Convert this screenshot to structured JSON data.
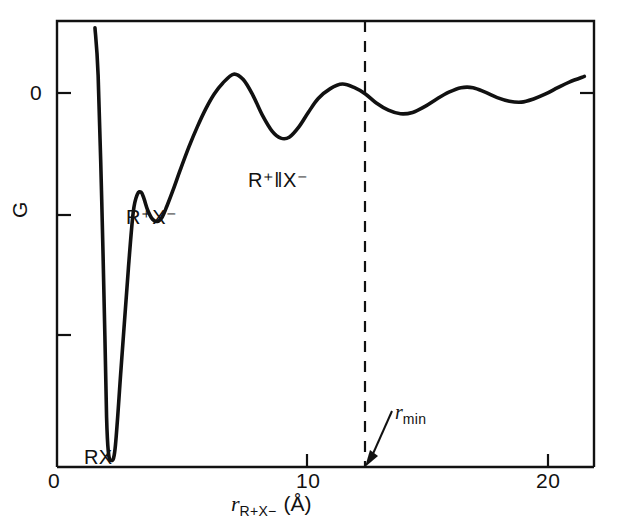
{
  "figure": {
    "background_color": "#ffffff",
    "line_color": "#111111",
    "axis_color": "#111111"
  },
  "axes": {
    "x": {
      "title_symbol": "r",
      "title_subscript": "R+X−",
      "title_units": "(Å)",
      "tick_labels": [
        "0",
        "10",
        "20"
      ],
      "tick_values": [
        0,
        10,
        20
      ],
      "range": [
        0,
        22.2
      ]
    },
    "y": {
      "title": "G",
      "tick_labels": [
        "0"
      ],
      "zero_label": "0"
    }
  },
  "annotations": {
    "rx": "RX",
    "contact_ion_pair": "R⁺X⁻",
    "solvent_separated_ion_pair": "R⁺‖X⁻",
    "rmin_symbol": "r",
    "rmin_subscript": "min"
  },
  "chart_data": {
    "type": "line",
    "title": "",
    "xlabel": "r_{R+X-} (Å)",
    "ylabel": "G",
    "xlim": [
      0,
      22.2
    ],
    "ylim": [
      -8.5,
      1.4
    ],
    "grid": false,
    "legend": null,
    "xticks": [
      0,
      10,
      20
    ],
    "xticklabels": [
      "0",
      "10",
      "20"
    ],
    "yticks": [
      0,
      -2.5,
      -5.0
    ],
    "yticklabels": [
      "0",
      "",
      ""
    ],
    "series": [
      {
        "name": "potential-of-mean-force",
        "comment": "Free energy G versus ion-pair separation; steep repulsive wall, deep RX covalent minimum, contact ion pair R+X-, solvent-separated ion pair R+||X-, then damped oscillations decaying toward zero.",
        "x": [
          1.57,
          1.7,
          1.85,
          1.98,
          2.05,
          2.12,
          2.22,
          2.4,
          2.65,
          2.95,
          3.15,
          3.32,
          3.48,
          3.6,
          3.75,
          3.95,
          4.15,
          4.35,
          4.55,
          4.8,
          5.1,
          5.45,
          5.8,
          6.15,
          6.5,
          6.85,
          7.3,
          7.7,
          8.1,
          8.5,
          8.9,
          9.25,
          9.6,
          10.0,
          10.4,
          10.8,
          11.3,
          11.8,
          12.3,
          12.75,
          13.2,
          13.7,
          14.2,
          14.7,
          15.2,
          15.7,
          16.2,
          16.7,
          17.2,
          17.7,
          18.2,
          18.7,
          19.2,
          19.7,
          20.2,
          20.7,
          21.2,
          21.8
        ],
        "y": [
          1.25,
          0.2,
          -2.6,
          -5.6,
          -7.4,
          -8.15,
          -8.35,
          -8.1,
          -6.3,
          -4.1,
          -2.85,
          -2.45,
          -2.4,
          -2.55,
          -2.8,
          -3.0,
          -3.05,
          -2.95,
          -2.7,
          -2.35,
          -1.9,
          -1.4,
          -0.95,
          -0.55,
          -0.22,
          0.02,
          0.22,
          0.1,
          -0.25,
          -0.7,
          -1.05,
          -1.2,
          -1.18,
          -0.95,
          -0.62,
          -0.32,
          -0.1,
          0.0,
          -0.08,
          -0.22,
          -0.42,
          -0.58,
          -0.66,
          -0.63,
          -0.5,
          -0.33,
          -0.18,
          -0.08,
          -0.08,
          -0.18,
          -0.3,
          -0.38,
          -0.4,
          -0.33,
          -0.22,
          -0.08,
          0.05,
          0.17
        ]
      }
    ],
    "annotations": [
      {
        "text": "RX",
        "x": 2.05,
        "y": -8.6,
        "type": "species-label"
      },
      {
        "text": "R+X-",
        "x": 3.9,
        "y": -3.55,
        "type": "species-label"
      },
      {
        "text": "R+||X-",
        "x": 9.3,
        "y": -1.75,
        "type": "species-label"
      },
      {
        "text": "r_min",
        "x": 14.0,
        "y": -6.9,
        "type": "arrow-label",
        "arrow_to_x": 12.75,
        "arrow_to_y": -8.95
      }
    ],
    "vlines": [
      {
        "x": 12.75,
        "style": "dashed",
        "label": "r_min"
      }
    ]
  }
}
